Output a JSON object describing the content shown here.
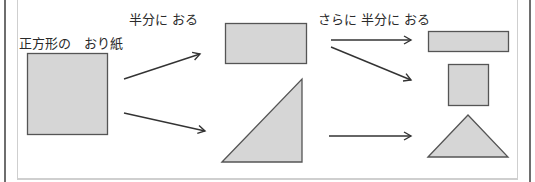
{
  "labels": {
    "square_origami": "正方形の　おり紙",
    "fold_half": "半分に おる",
    "fold_half_again": "さらに 半分に おる"
  },
  "colors": {
    "shape_fill": "#d6d6d6",
    "shape_stroke": "#555555",
    "arrow_stroke": "#333333",
    "text": "#2a2a2a"
  },
  "diagram": {
    "stages": [
      {
        "name": "square origami",
        "shapes": [
          "square"
        ]
      },
      {
        "name": "folded in half",
        "shapes": [
          "rectangle",
          "right-triangle"
        ]
      },
      {
        "name": "folded in half again",
        "shapes": [
          "thin-rectangle",
          "small-square",
          "isosceles-triangle"
        ]
      }
    ]
  }
}
